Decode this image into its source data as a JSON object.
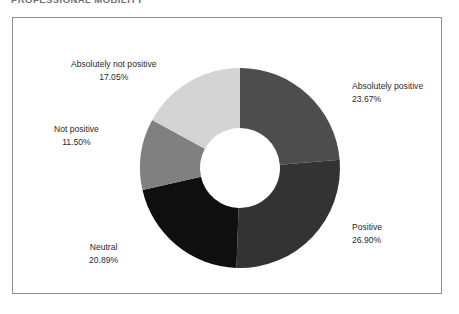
{
  "document": {
    "heading": "PROFESSIONAL MOBILITY"
  },
  "chart_data": {
    "type": "pie",
    "variant": "donut",
    "title": "",
    "subtitle": "",
    "xlabel": "",
    "ylabel": "",
    "legend_position": "none",
    "labels_position": "outside-callout",
    "grid": false,
    "start_angle_deg": 0,
    "direction": "clockwise",
    "inner_radius_ratio": 0.4,
    "value_unit": "%",
    "categories": [
      "Absolutely positive",
      "Positive",
      "Neutral",
      "Not positive",
      "Absolutely not positive"
    ],
    "values": [
      23.67,
      26.9,
      20.89,
      11.5,
      17.05
    ],
    "value_labels": [
      "23.67%",
      "26.90%",
      "20.89%",
      "11.50%",
      "17.05%"
    ],
    "colors": [
      "#4d4d4d",
      "#333333",
      "#0f0f0f",
      "#808080",
      "#d4d4d4"
    ],
    "slices": [
      {
        "name": "Absolutely positive",
        "value": 23.67,
        "value_label": "23.67%",
        "color": "#4d4d4d"
      },
      {
        "name": "Positive",
        "value": 26.9,
        "value_label": "26.90%",
        "color": "#333333"
      },
      {
        "name": "Neutral",
        "value": 20.89,
        "value_label": "20.89%",
        "color": "#0f0f0f"
      },
      {
        "name": "Not positive",
        "value": 11.5,
        "value_label": "11.50%",
        "color": "#808080"
      },
      {
        "name": "Absolutely not positive",
        "value": 17.05,
        "value_label": "17.05%",
        "color": "#d4d4d4"
      }
    ]
  },
  "panel": {
    "background": "#ffffff",
    "border_color": "#8e8e8e"
  }
}
